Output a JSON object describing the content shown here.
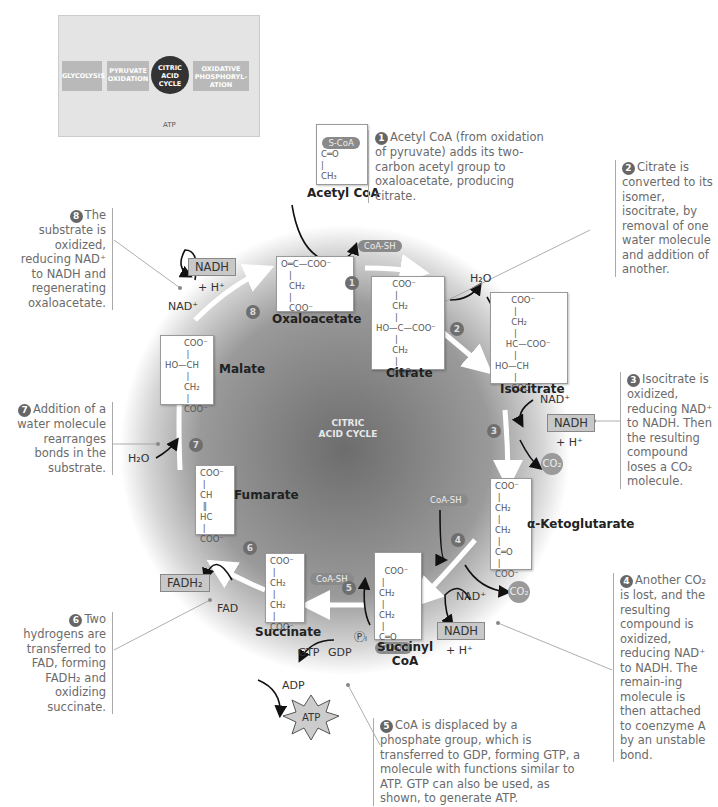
{
  "overview_inset": {
    "stages": [
      "GLYCOLYSIS",
      "PYRUVATE OXIDATION",
      "CITRIC ACID CYCLE",
      "OXIDATIVE PHOSPHORYL-ATION"
    ],
    "atp_label": "ATP"
  },
  "center_label": "CITRIC ACID CYCLE",
  "molecules": {
    "acetyl_coa": {
      "name": "Acetyl CoA",
      "tag": "S-CoA",
      "formula": "C═O\n|\nCH₃"
    },
    "oxaloacetate": {
      "name": "Oxaloacetate",
      "formula": "O═C—COO⁻\n   |\n   CH₂\n   |\n   COO⁻"
    },
    "citrate": {
      "name": "Citrate",
      "formula": "      COO⁻\n       |\n      CH₂\n       |\nHO—C—COO⁻\n       |\n      CH₂\n       |\n      COO⁻"
    },
    "isocitrate": {
      "name": "Isocitrate",
      "formula": "      COO⁻\n       |\n      CH₂\n       |\n    HC—COO⁻\n       |\nHO—CH\n       |\n      COO⁻"
    },
    "alpha_ketoglutarate": {
      "name": "α-Ketoglutarate",
      "formula": "COO⁻\n |\nCH₂\n |\nCH₂\n |\nC═O\n |\nCOO⁻"
    },
    "succinyl_coa": {
      "name": "Succinyl CoA",
      "tag": "S-CoA",
      "formula": "COO⁻\n |\nCH₂\n |\nCH₂\n |\nC═O"
    },
    "succinate": {
      "name": "Succinate",
      "formula": "COO⁻\n |\nCH₂\n |\nCH₂\n |\nCOO⁻"
    },
    "fumarate": {
      "name": "Fumarate",
      "formula": "COO⁻\n |\nCH\n ‖\nHC\n |\nCOO⁻"
    },
    "malate": {
      "name": "Malate",
      "formula": "       COO⁻\n        |\nHO—CH\n        |\n       CH₂\n        |\n       COO⁻"
    }
  },
  "cofactors": {
    "coa_sh": "CoA-SH",
    "h2o": "H₂O",
    "nad": "NAD⁺",
    "nadh": "NADH",
    "h_plus": "+ H⁺",
    "co2": "CO₂",
    "fad": "FAD",
    "fadh2": "FADH₂",
    "gtp": "GTP",
    "gdp": "GDP",
    "adp": "ADP",
    "atp": "ATP",
    "pi": "Ⓟᵢ"
  },
  "steps": [
    "1",
    "2",
    "3",
    "4",
    "5",
    "6",
    "7",
    "8"
  ],
  "captions": {
    "step1": "Acetyl CoA (from oxidation of pyruvate) adds its two-carbon acetyl group to oxaloacetate, producing citrate.",
    "step2": "Citrate is converted to its isomer, isocitrate, by removal of one water molecule and addition of another.",
    "step3": "Isocitrate is oxidized, reducing NAD⁺ to NADH. Then the resulting compound loses a CO₂ molecule.",
    "step4": "Another CO₂ is lost, and the resulting compound is oxidized, reducing NAD⁺ to NADH. The remain-ing molecule is then attached to coenzyme A by an unstable bond.",
    "step5": "CoA is displaced by a phosphate group, which is transferred to GDP, forming GTP, a molecule with functions similar to ATP. GTP can also be used, as shown, to generate ATP.",
    "step6": "Two hydrogens are transferred to FAD, forming FADH₂ and oxidizing succinate.",
    "step7": "Addition of a water molecule rearranges bonds in the substrate.",
    "step8": "The substrate is oxidized, reducing NAD⁺ to NADH and regenerating oxaloacetate."
  },
  "colors": {
    "cycle_center": "#7a7a7a",
    "cycle_edge": "#ffffff",
    "arrow": "#ffffff",
    "caption_text": "#6b6b6b",
    "box_fill": "#c8c8c8"
  }
}
